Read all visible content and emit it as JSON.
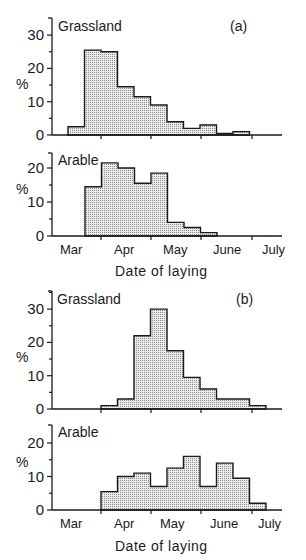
{
  "figure": {
    "panel_a_label": "(a)",
    "panel_b_label": "(b)",
    "xlabel": "Date of laying",
    "ylabel": "%",
    "months": [
      "Mar",
      "Apr",
      "May",
      "June",
      "July"
    ]
  },
  "colors": {
    "fill": "#d4d4d4",
    "stroke": "#1a1a1a"
  },
  "chart_data": [
    {
      "type": "bar",
      "title": "Grassland (a)",
      "xlabel": "Date of laying",
      "ylabel": "%",
      "ylim": [
        0,
        30
      ],
      "yticks": [
        0,
        10,
        20,
        30
      ],
      "categories": [
        "Mar wk3",
        "Mar wk4",
        "Apr wk1",
        "Apr wk2",
        "Apr wk3",
        "Apr wk4",
        "May wk1",
        "May wk2",
        "May wk3",
        "May wk4",
        "June wk1"
      ],
      "values": [
        2.5,
        25.5,
        25,
        14.5,
        11.5,
        9,
        4,
        2,
        3,
        0.5,
        1
      ],
      "start_x": 68,
      "bin_width": 16.5,
      "y0": 135,
      "px_per_unit": 3.33
    },
    {
      "type": "bar",
      "title": "Arable (a)",
      "xlabel": "Date of laying",
      "ylabel": "%",
      "ylim": [
        0,
        23
      ],
      "yticks": [
        0,
        10,
        20
      ],
      "categories": [
        "Mar wk4",
        "Apr wk1",
        "Apr wk2",
        "Apr wk3",
        "Apr wk4",
        "May wk1",
        "May wk2",
        "May wk3"
      ],
      "values": [
        14.5,
        21.5,
        20,
        15.5,
        18.5,
        4,
        2.5,
        1
      ],
      "start_x": 85,
      "bin_width": 16.5,
      "y0": 236,
      "px_per_unit": 3.4
    },
    {
      "type": "bar",
      "title": "Grassland (b)",
      "xlabel": "Date of laying",
      "ylabel": "%",
      "ylim": [
        0,
        35
      ],
      "yticks": [
        0,
        10,
        20,
        30
      ],
      "categories": [
        "Apr wk1",
        "Apr wk2",
        "Apr wk3",
        "Apr wk4",
        "May wk1",
        "May wk2",
        "May wk3",
        "May wk4",
        "June wk1",
        "June wk2"
      ],
      "values": [
        1,
        3,
        22,
        30,
        17.5,
        9.5,
        6,
        3,
        3,
        1
      ],
      "start_x": 101,
      "bin_width": 16.5,
      "y0": 409,
      "px_per_unit": 3.33
    },
    {
      "type": "bar",
      "title": "Arable (b)",
      "xlabel": "Date of laying",
      "ylabel": "%",
      "ylim": [
        0,
        23
      ],
      "yticks": [
        0,
        10,
        20
      ],
      "categories": [
        "Apr wk1",
        "Apr wk2",
        "Apr wk3",
        "Apr wk4",
        "May wk1",
        "May wk2",
        "May wk3",
        "May wk4",
        "June wk1",
        "June wk2"
      ],
      "values": [
        5.5,
        10,
        11,
        7,
        12.5,
        16,
        7,
        14,
        9.5,
        2
      ],
      "start_x": 101,
      "bin_width": 16.5,
      "y0": 510,
      "px_per_unit": 3.35
    }
  ],
  "panels": [
    {
      "title": "Grassland",
      "tag": "(a)"
    },
    {
      "title": "Arable",
      "tag": ""
    },
    {
      "title": "Grassland",
      "tag": "(b)"
    },
    {
      "title": "Arable",
      "tag": ""
    }
  ]
}
